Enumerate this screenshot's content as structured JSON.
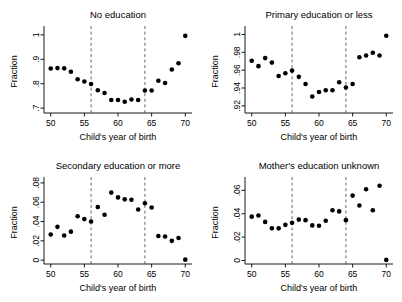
{
  "figure": {
    "width": 402,
    "height": 302,
    "background": "#ffffff",
    "marker_color": "#000000",
    "axis_color": "#000000",
    "refline_color": "#555555"
  },
  "chart_data": [
    {
      "type": "scatter",
      "title": "No education",
      "xlabel": "Child's year of birth",
      "ylabel": "Fraction",
      "xlim": [
        49,
        71
      ],
      "ylim": [
        0.68,
        1.02
      ],
      "xticks": [
        50,
        55,
        60,
        65,
        70
      ],
      "xticklabels": [
        "50",
        "55",
        "60",
        "65",
        "70"
      ],
      "yticks": [
        0.7,
        0.8,
        0.9,
        1
      ],
      "yticklabels": [
        ".7",
        ".8",
        ".9",
        "1"
      ],
      "grid": false,
      "legend": "none",
      "vlines": [
        56,
        64
      ],
      "x": [
        50,
        51,
        52,
        53,
        54,
        55,
        56,
        57,
        58,
        59,
        60,
        61,
        62,
        63,
        64,
        65,
        66,
        67,
        68,
        69,
        70
      ],
      "values": [
        0.862,
        0.864,
        0.863,
        0.849,
        0.818,
        0.809,
        0.799,
        0.773,
        0.762,
        0.733,
        0.733,
        0.726,
        0.735,
        0.733,
        0.772,
        0.772,
        0.812,
        0.803,
        0.858,
        0.884,
        0.996
      ]
    },
    {
      "type": "scatter",
      "title": "Primary education or less",
      "xlabel": "Child's year of birth",
      "ylabel": "Fraction",
      "xlim": [
        49,
        71
      ],
      "ylim": [
        0.912,
        1.005
      ],
      "xticks": [
        50,
        55,
        60,
        65,
        70
      ],
      "xticklabels": [
        "50",
        "55",
        "60",
        "65",
        "70"
      ],
      "yticks": [
        0.92,
        0.94,
        0.96,
        0.98,
        1
      ],
      "yticklabels": [
        ".92",
        ".94",
        ".96",
        ".98",
        "1"
      ],
      "grid": false,
      "legend": "none",
      "vlines": [
        56,
        64
      ],
      "x": [
        50,
        51,
        52,
        53,
        54,
        55,
        56,
        57,
        58,
        59,
        60,
        61,
        62,
        63,
        64,
        65,
        66,
        67,
        68,
        69,
        70
      ],
      "values": [
        0.9705,
        0.9645,
        0.9735,
        0.9685,
        0.9535,
        0.9565,
        0.9595,
        0.9525,
        0.9445,
        0.9305,
        0.9355,
        0.9375,
        0.9375,
        0.9465,
        0.9405,
        0.9445,
        0.9745,
        0.9765,
        0.9795,
        0.9765,
        0.9985
      ]
    },
    {
      "type": "scatter",
      "title": "Secondary education or more",
      "xlabel": "Child's year of birth",
      "ylabel": "Fraction",
      "xlim": [
        49,
        71
      ],
      "ylim": [
        -0.004,
        0.082
      ],
      "xticks": [
        50,
        55,
        60,
        65,
        70
      ],
      "xticklabels": [
        "50",
        "55",
        "60",
        "65",
        "70"
      ],
      "yticks": [
        0,
        0.02,
        0.04,
        0.06,
        0.08
      ],
      "yticklabels": [
        "0",
        ".02",
        ".04",
        ".06",
        ".08"
      ],
      "grid": false,
      "legend": "none",
      "vlines": [
        56,
        64
      ],
      "x": [
        50,
        51,
        52,
        53,
        54,
        55,
        56,
        57,
        58,
        59,
        60,
        61,
        62,
        63,
        64,
        65,
        66,
        67,
        68,
        69,
        70
      ],
      "values": [
        0.0265,
        0.0345,
        0.0255,
        0.0295,
        0.0455,
        0.0425,
        0.04,
        0.055,
        0.047,
        0.07,
        0.065,
        0.063,
        0.0625,
        0.0525,
        0.059,
        0.0545,
        0.025,
        0.0245,
        0.02,
        0.023,
        0.0005
      ]
    },
    {
      "type": "scatter",
      "title": "Mother's education unknown",
      "xlabel": "Child's year of birth",
      "ylabel": "Fraction",
      "xlim": [
        49,
        71
      ],
      "ylim": [
        -0.003,
        0.068
      ],
      "xticks": [
        50,
        55,
        60,
        65,
        70
      ],
      "xticklabels": [
        "50",
        "55",
        "60",
        "65",
        "70"
      ],
      "yticks": [
        0,
        0.02,
        0.04,
        0.06
      ],
      "yticklabels": [
        "0",
        ".02",
        ".04",
        ".06"
      ],
      "grid": false,
      "legend": "none",
      "vlines": [
        56,
        64
      ],
      "x": [
        50,
        51,
        52,
        53,
        54,
        55,
        56,
        57,
        58,
        59,
        60,
        61,
        62,
        63,
        64,
        65,
        66,
        67,
        68,
        69,
        70
      ],
      "values": [
        0.0375,
        0.0385,
        0.033,
        0.0275,
        0.0275,
        0.0305,
        0.0322,
        0.035,
        0.0345,
        0.03,
        0.0297,
        0.034,
        0.043,
        0.042,
        0.0345,
        0.0555,
        0.047,
        0.061,
        0.043,
        0.064,
        0.0005
      ]
    }
  ]
}
